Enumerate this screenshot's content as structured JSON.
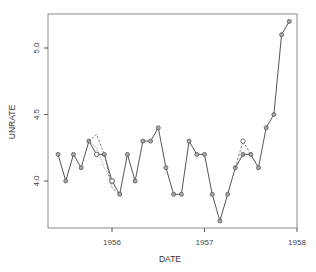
{
  "chart_data": {
    "type": "line",
    "title": "",
    "xlabel": "DATE",
    "ylabel": "UNRATE",
    "xlim": [
      1955.4,
      1958.0
    ],
    "ylim": [
      3.65,
      5.35
    ],
    "grid": false,
    "legend": null,
    "x_ticks": [
      {
        "value": 1956,
        "label": "1956"
      },
      {
        "value": 1957,
        "label": "1957"
      },
      {
        "value": 1958,
        "label": "1958"
      }
    ],
    "y_ticks": [
      {
        "value": 4.0,
        "label": "4.0"
      },
      {
        "value": 4.5,
        "label": "4.5"
      },
      {
        "value": 5.0,
        "label": "5.0"
      }
    ],
    "x": [
      "1955-06",
      "1955-07",
      "1955-08",
      "1955-09",
      "1955-10",
      "1955-11",
      "1955-12",
      "1956-01",
      "1956-02",
      "1956-03",
      "1956-04",
      "1956-05",
      "1956-06",
      "1956-07",
      "1956-08",
      "1956-09",
      "1956-10",
      "1956-11",
      "1956-12",
      "1957-01",
      "1957-02",
      "1957-03",
      "1957-04",
      "1957-05",
      "1957-06",
      "1957-07",
      "1957-08",
      "1957-09",
      "1957-10",
      "1957-11",
      "1957-12"
    ],
    "series": [
      {
        "name": "UNRATE",
        "style": "solid",
        "marker": "circle",
        "values": [
          4.2,
          4.0,
          4.2,
          4.1,
          4.3,
          4.2,
          4.2,
          4.0,
          3.9,
          4.2,
          4.0,
          4.3,
          4.3,
          4.4,
          4.1,
          3.9,
          3.9,
          4.3,
          4.2,
          4.2,
          3.9,
          3.7,
          3.9,
          4.1,
          4.2,
          4.2,
          4.1,
          4.4,
          4.5,
          5.1,
          5.2
        ]
      },
      {
        "name": "imputed-segment-1",
        "style": "dashed",
        "points": [
          {
            "x": "1955-10",
            "y": 4.3
          },
          {
            "x": "1955-11",
            "y": 4.35
          },
          {
            "x": "1955-12",
            "y": 4.2
          },
          {
            "x": "1956-01",
            "y": 3.95
          },
          {
            "x": "1956-02",
            "y": 3.9
          }
        ]
      },
      {
        "name": "imputed-segment-2",
        "style": "dotted",
        "points": [
          {
            "x": "1955-10",
            "y": 4.3
          },
          {
            "x": "1955-11",
            "y": 4.25
          },
          {
            "x": "1955-12",
            "y": 4.1
          },
          {
            "x": "1956-01",
            "y": 4.0
          },
          {
            "x": "1956-02",
            "y": 3.9
          }
        ]
      },
      {
        "name": "imputed-segment-3",
        "style": "dashed",
        "points": [
          {
            "x": "1957-05",
            "y": 4.1
          },
          {
            "x": "1957-06",
            "y": 4.3
          },
          {
            "x": "1957-07",
            "y": 4.2
          }
        ]
      },
      {
        "name": "imputed-segment-4",
        "style": "dashed",
        "points": [
          {
            "x": "1957-05",
            "y": 4.1
          },
          {
            "x": "1957-06",
            "y": 4.2
          },
          {
            "x": "1957-07",
            "y": 4.2
          }
        ]
      },
      {
        "name": "original-open-markers",
        "style": "none",
        "marker": "open",
        "points": [
          {
            "x": "1955-11",
            "y": 4.2,
            "shape": "circle"
          },
          {
            "x": "1956-01",
            "y": 4.0,
            "shape": "square"
          },
          {
            "x": "1957-06",
            "y": 4.3,
            "shape": "circle"
          }
        ]
      }
    ]
  },
  "colors": {
    "line": "#555555",
    "marker_fill": "#aaaaaa",
    "axis": "#555555",
    "frame": "#888888"
  }
}
